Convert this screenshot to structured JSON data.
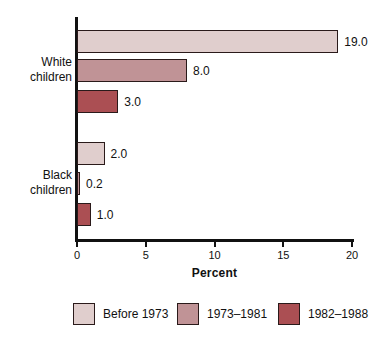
{
  "chart_data": {
    "type": "bar",
    "orientation": "horizontal",
    "title": "",
    "xlabel": "Percent",
    "ylabel": "",
    "xlim": [
      0,
      20
    ],
    "grid": false,
    "legend_position": "bottom",
    "categories": [
      "White children",
      "Black children"
    ],
    "series": [
      {
        "name": "Before 1973",
        "color": "#e0cecd",
        "values": [
          19.0,
          2.0
        ]
      },
      {
        "name": "1973–1981",
        "color": "#c09396",
        "values": [
          8.0,
          0.2
        ]
      },
      {
        "name": "1982–1988",
        "color": "#ab4f53",
        "values": [
          3.0,
          1.0
        ]
      }
    ],
    "bars": [
      {
        "group": "White children",
        "series": "Before 1973",
        "value": 19.0,
        "label": "19.0",
        "color": "#e0cecd"
      },
      {
        "group": "White children",
        "series": "1973–1981",
        "value": 8.0,
        "label": "8.0",
        "color": "#c09396"
      },
      {
        "group": "White children",
        "series": "1982–1988",
        "value": 3.0,
        "label": "3.0",
        "color": "#ab4f53"
      },
      {
        "group": "Black children",
        "series": "Before 1973",
        "value": 2.0,
        "label": "2.0",
        "color": "#e0cecd"
      },
      {
        "group": "Black children",
        "series": "1973–1981",
        "value": 0.2,
        "label": "0.2",
        "color": "#c09396"
      },
      {
        "group": "Black children",
        "series": "1982–1988",
        "value": 1.0,
        "label": "1.0",
        "color": "#ab4f53"
      }
    ],
    "xticks": [
      {
        "value": 0,
        "label": "0"
      },
      {
        "value": 5,
        "label": "5"
      },
      {
        "value": 10,
        "label": "10"
      },
      {
        "value": 15,
        "label": "15"
      },
      {
        "value": 20,
        "label": "20"
      }
    ]
  },
  "axis": {
    "x_title": "Percent"
  },
  "group_labels": {
    "white": {
      "line1": "White",
      "line2": "children"
    },
    "black": {
      "line1": "Black",
      "line2": "children"
    }
  },
  "legend": {
    "items": [
      {
        "label": "Before 1973",
        "color": "#e0cecd"
      },
      {
        "label": "1973–1981",
        "color": "#c09396"
      },
      {
        "label": "1982–1988",
        "color": "#ab4f53"
      }
    ]
  }
}
